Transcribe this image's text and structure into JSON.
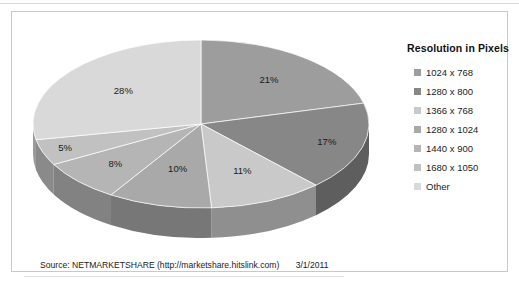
{
  "chart_data": {
    "type": "pie",
    "title": "",
    "legend_title": "Resolution in Pixels",
    "legend_position": "right",
    "grid": false,
    "categories": [
      "1024 x 768",
      "1280 x 800",
      "1366 x 768",
      "1280 x 1024",
      "1440 x 900",
      "1680 x 1050",
      "Other"
    ],
    "values": [
      21,
      17,
      11,
      10,
      8,
      5,
      28
    ],
    "value_labels": [
      "21%",
      "17%",
      "11%",
      "10%",
      "8%",
      "5%",
      "28%"
    ],
    "unit": "%",
    "colors": [
      "#9d9d9d",
      "#878787",
      "#c9c9c9",
      "#a9a9a9",
      "#b5b5b5",
      "#c1c1c1",
      "#d9d9d9"
    ],
    "side_colors": [
      "#6f6f6f",
      "#5e5e5e",
      "#8f8f8f",
      "#777777",
      "#828282",
      "#8a8a8a",
      "#9b9b9b"
    ],
    "xlabel": "",
    "ylabel": ""
  },
  "legend": {
    "title": "Resolution in Pixels",
    "items": [
      {
        "label": "1024 x 768",
        "color": "#9d9d9d"
      },
      {
        "label": "1280 x 800",
        "color": "#878787"
      },
      {
        "label": "1366 x 768",
        "color": "#c9c9c9"
      },
      {
        "label": "1280 x 1024",
        "color": "#a9a9a9"
      },
      {
        "label": "1440 x 900",
        "color": "#b5b5b5"
      },
      {
        "label": "1680 x 1050",
        "color": "#c1c1c1"
      },
      {
        "label": "Other",
        "color": "#d9d9d9"
      }
    ]
  },
  "footer": {
    "source": "Source: NETMARKETSHARE (http://marketshare.hitslink.com)",
    "date": "3/1/2011"
  }
}
